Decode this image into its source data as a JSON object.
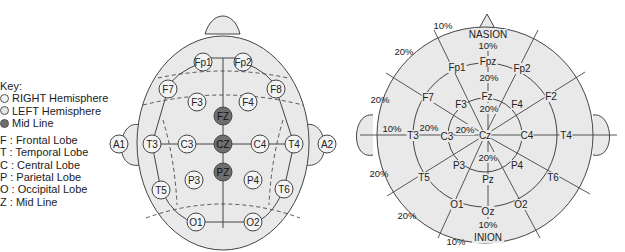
{
  "colors": {
    "head_fill": "#e9e9e9",
    "line": "#444444",
    "electrode_fill": "#f4f4f4",
    "midline_fill": "#6e6e6e",
    "text": "#222222"
  },
  "key": {
    "title": "Key:",
    "swatches": [
      {
        "label": "RIGHT Hemisphere",
        "color": "#f4f4f4"
      },
      {
        "label": "LEFT Hemisphere",
        "color": "#e6e6e6"
      },
      {
        "label": "Mid Line",
        "color": "#6e6e6e"
      }
    ],
    "lobes": [
      "F : Frontal Lobe",
      "T : Temporal Lobe",
      "C : Central Lobe",
      "P : Parietal Lobe",
      "O : Occipital Lobe",
      "Z : Mid Line"
    ]
  },
  "left_diagram": {
    "electrodes": [
      {
        "label": "Fp1",
        "x": 203,
        "y": 62,
        "mid": false
      },
      {
        "label": "Fp2",
        "x": 243,
        "y": 62,
        "mid": false
      },
      {
        "label": "F7",
        "x": 168,
        "y": 89,
        "mid": false
      },
      {
        "label": "F8",
        "x": 276,
        "y": 89,
        "mid": false
      },
      {
        "label": "F3",
        "x": 197,
        "y": 102,
        "mid": false
      },
      {
        "label": "F4",
        "x": 248,
        "y": 102,
        "mid": false
      },
      {
        "label": "FZ",
        "x": 223,
        "y": 116,
        "mid": true
      },
      {
        "label": "A1",
        "x": 119,
        "y": 144,
        "mid": false
      },
      {
        "label": "T3",
        "x": 152,
        "y": 144,
        "mid": false
      },
      {
        "label": "C3",
        "x": 187,
        "y": 144,
        "mid": false
      },
      {
        "label": "CZ",
        "x": 223,
        "y": 144,
        "mid": true
      },
      {
        "label": "C4",
        "x": 260,
        "y": 144,
        "mid": false
      },
      {
        "label": "T4",
        "x": 294,
        "y": 144,
        "mid": false
      },
      {
        "label": "A2",
        "x": 327,
        "y": 144,
        "mid": false
      },
      {
        "label": "PZ",
        "x": 223,
        "y": 172,
        "mid": true
      },
      {
        "label": "P3",
        "x": 194,
        "y": 180,
        "mid": false
      },
      {
        "label": "P4",
        "x": 253,
        "y": 180,
        "mid": false
      },
      {
        "label": "T5",
        "x": 161,
        "y": 190,
        "mid": false
      },
      {
        "label": "T6",
        "x": 284,
        "y": 189,
        "mid": false
      },
      {
        "label": "O1",
        "x": 196,
        "y": 222,
        "mid": false
      },
      {
        "label": "O2",
        "x": 253,
        "y": 222,
        "mid": false
      }
    ]
  },
  "right_diagram": {
    "landmarks": {
      "top": "NASION",
      "bottom": "INION"
    },
    "electrodes": [
      {
        "label": "Fpz",
        "x": 488,
        "y": 61
      },
      {
        "label": "Fp1",
        "x": 457,
        "y": 67
      },
      {
        "label": "Fp2",
        "x": 522,
        "y": 68
      },
      {
        "label": "F7",
        "x": 428,
        "y": 97
      },
      {
        "label": "F3",
        "x": 461,
        "y": 104
      },
      {
        "label": "Fz",
        "x": 487,
        "y": 96
      },
      {
        "label": "F4",
        "x": 517,
        "y": 104
      },
      {
        "label": "F2",
        "x": 551,
        "y": 96
      },
      {
        "label": "T3",
        "x": 413,
        "y": 135
      },
      {
        "label": "C3",
        "x": 447,
        "y": 136
      },
      {
        "label": "Cz",
        "x": 485,
        "y": 135
      },
      {
        "label": "C4",
        "x": 527,
        "y": 135
      },
      {
        "label": "T4",
        "x": 566,
        "y": 135
      },
      {
        "label": "P3",
        "x": 459,
        "y": 165
      },
      {
        "label": "P4",
        "x": 517,
        "y": 165
      },
      {
        "label": "Pz",
        "x": 488,
        "y": 179
      },
      {
        "label": "T5",
        "x": 424,
        "y": 177
      },
      {
        "label": "T6",
        "x": 553,
        "y": 177
      },
      {
        "label": "O1",
        "x": 457,
        "y": 204
      },
      {
        "label": "Oz",
        "x": 488,
        "y": 211
      },
      {
        "label": "O2",
        "x": 521,
        "y": 204
      }
    ],
    "percent_labels": [
      {
        "text": "10%",
        "x": 443,
        "y": 29
      },
      {
        "text": "10%",
        "x": 488,
        "y": 49
      },
      {
        "text": "20%",
        "x": 404,
        "y": 55
      },
      {
        "text": "20%",
        "x": 489,
        "y": 81
      },
      {
        "text": "20%",
        "x": 380,
        "y": 103
      },
      {
        "text": "20%",
        "x": 489,
        "y": 112
      },
      {
        "text": "10%",
        "x": 392,
        "y": 132
      },
      {
        "text": "20%",
        "x": 429,
        "y": 131
      },
      {
        "text": "20%",
        "x": 465,
        "y": 133
      },
      {
        "text": "20%",
        "x": 488,
        "y": 161
      },
      {
        "text": "20%",
        "x": 379,
        "y": 177
      },
      {
        "text": "20%",
        "x": 407,
        "y": 219
      },
      {
        "text": "10%",
        "x": 488,
        "y": 228
      },
      {
        "text": "10%",
        "x": 456,
        "y": 245
      }
    ]
  }
}
